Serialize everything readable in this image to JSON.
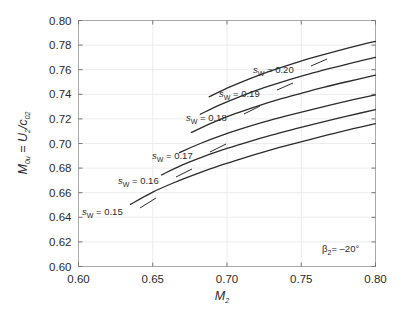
{
  "figure": {
    "background_color": "#ffffff",
    "plot_border_color": "#aaaaaa",
    "grid_color": "#ececec",
    "curve_color": "#2b2b2b",
    "text_color": "#2b2b2b"
  },
  "axes": {
    "x_title_main": "M",
    "x_title_sub": "2",
    "y_title_m": "M",
    "y_title_m_sub": "0u",
    "y_title_eq": " = ",
    "y_title_u": "U",
    "y_title_u_sub": "2",
    "y_title_slash": "/",
    "y_title_c": "c",
    "y_title_c_sub": "02",
    "x_ticklabels": [
      "0.60",
      "0.65",
      "0.70",
      "0.75",
      "0.80"
    ],
    "y_ticklabels": [
      "0.60",
      "0.62",
      "0.64",
      "0.66",
      "0.68",
      "0.70",
      "0.72",
      "0.74",
      "0.76",
      "0.78",
      "0.80"
    ]
  },
  "annotation": {
    "beta_symbol": "β",
    "beta_sub": "2",
    "beta_eq_value": "= –20°",
    "full_text": "β₂ = –20°"
  },
  "curve_labels": [
    {
      "s": "s",
      "sub": "W",
      "eq": "= 0.15"
    },
    {
      "s": "s",
      "sub": "W",
      "eq": "= 0.16"
    },
    {
      "s": "s",
      "sub": "W",
      "eq": "= 0.17"
    },
    {
      "s": "s",
      "sub": "W",
      "eq": "= 0.18"
    },
    {
      "s": "s",
      "sub": "W",
      "eq": "= 0.19"
    },
    {
      "s": "s",
      "sub": "W",
      "eq": "= 0.20"
    }
  ],
  "chart_data": {
    "type": "line",
    "title": "",
    "xlabel": "M_2",
    "ylabel": "M_0u = U_2/c_02",
    "xlim": [
      0.6,
      0.8
    ],
    "ylim": [
      0.6,
      0.8
    ],
    "xticks": [
      0.6,
      0.65,
      0.7,
      0.75,
      0.8
    ],
    "yticks": [
      0.6,
      0.62,
      0.64,
      0.66,
      0.68,
      0.7,
      0.72,
      0.74,
      0.76,
      0.78,
      0.8
    ],
    "grid": true,
    "legend": "inline curve labels",
    "annotations": [
      "β₂ = –20°"
    ],
    "series": [
      {
        "name": "s_W = 0.15",
        "x": [
          0.635,
          0.65,
          0.665,
          0.68,
          0.695,
          0.71,
          0.725,
          0.74,
          0.755,
          0.77,
          0.785,
          0.8
        ],
        "y": [
          0.6505,
          0.6605,
          0.6685,
          0.6755,
          0.682,
          0.6878,
          0.6932,
          0.6982,
          0.703,
          0.7076,
          0.712,
          0.7162
        ]
      },
      {
        "name": "s_W = 0.16",
        "x": [
          0.656,
          0.67,
          0.685,
          0.7,
          0.715,
          0.73,
          0.745,
          0.76,
          0.775,
          0.79,
          0.8
        ],
        "y": [
          0.6745,
          0.6826,
          0.6898,
          0.696,
          0.7016,
          0.7068,
          0.7116,
          0.7162,
          0.7206,
          0.7248,
          0.7275
        ]
      },
      {
        "name": "s_W = 0.17",
        "x": [
          0.668,
          0.682,
          0.696,
          0.71,
          0.725,
          0.74,
          0.755,
          0.77,
          0.785,
          0.8
        ],
        "y": [
          0.6926,
          0.7,
          0.7064,
          0.712,
          0.7175,
          0.7224,
          0.727,
          0.7314,
          0.7356,
          0.7396
        ]
      },
      {
        "name": "s_W = 0.18",
        "x": [
          0.676,
          0.69,
          0.705,
          0.72,
          0.735,
          0.75,
          0.765,
          0.78,
          0.8
        ],
        "y": [
          0.709,
          0.7168,
          0.724,
          0.7302,
          0.7358,
          0.7408,
          0.7456,
          0.75,
          0.7556
        ]
      },
      {
        "name": "s_W = 0.19",
        "x": [
          0.682,
          0.696,
          0.71,
          0.725,
          0.74,
          0.755,
          0.77,
          0.785,
          0.8
        ],
        "y": [
          0.7238,
          0.7318,
          0.7388,
          0.7454,
          0.7512,
          0.7564,
          0.7612,
          0.7658,
          0.77
        ]
      },
      {
        "name": "s_W = 0.20",
        "x": [
          0.688,
          0.702,
          0.716,
          0.73,
          0.745,
          0.76,
          0.775,
          0.79,
          0.8
        ],
        "y": [
          0.738,
          0.746,
          0.753,
          0.7592,
          0.7652,
          0.7706,
          0.7756,
          0.7802,
          0.783
        ]
      }
    ]
  }
}
